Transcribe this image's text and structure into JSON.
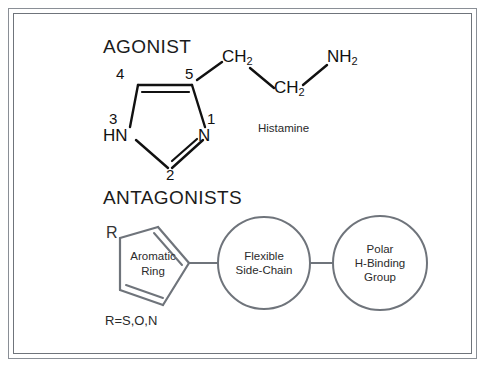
{
  "figure": {
    "title_agonist": "AGONIST",
    "title_antagonists": "ANTAGONISTS",
    "background_color": "#ffffff",
    "frame_color": "#8a8f96"
  },
  "agonist": {
    "molecule_name": "Histamine",
    "ring_name": "imidazole",
    "ring_position_labels": [
      "1",
      "2",
      "3",
      "4",
      "5"
    ],
    "ring_atom_labels": {
      "n1": "N",
      "n3": "HN"
    },
    "side_chain": [
      {
        "label": "CH",
        "subscript": "2"
      },
      {
        "label": "CH",
        "subscript": "2"
      },
      {
        "label": "NH",
        "subscript": "2"
      }
    ],
    "bond_color": "#111111"
  },
  "antagonists": {
    "aromatic_ring": {
      "line1": "Aromatic",
      "line2": "Ring",
      "r_group_label": "R",
      "r_group_definition": "R=S,O,N"
    },
    "groups": [
      {
        "line1": "Flexible",
        "line2": "Side-Chain",
        "line3": ""
      },
      {
        "line1": "Polar",
        "line2": "H-Binding",
        "line3": "Group"
      }
    ],
    "shape_color": "#6f747b"
  }
}
